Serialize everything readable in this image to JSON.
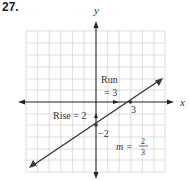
{
  "problem_number": "27.",
  "axes": {
    "x_label": "x",
    "y_label": "y"
  },
  "annotations": {
    "run_line1": "Run",
    "run_line2": "= 3",
    "rise": "Rise = 2",
    "x_intercept": "3",
    "y_intercept": "−2",
    "slope_m": "m =",
    "slope_num": "2",
    "slope_den": "3"
  },
  "graph": {
    "line": {
      "slope": "2/3",
      "y_intercept": -2,
      "x_intercept": 3
    },
    "grid": {
      "x_range": [
        -6,
        6
      ],
      "y_range": [
        -6,
        6
      ]
    },
    "colors": {
      "line": "#3a3a3a",
      "grid": "#d0d0d0",
      "axis": "#222222"
    }
  }
}
